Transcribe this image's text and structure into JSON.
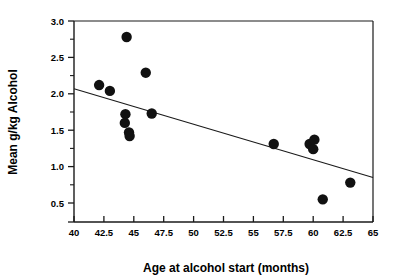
{
  "chart_data": {
    "type": "scatter",
    "title": "",
    "xlabel": "Age at alcohol start (months)",
    "ylabel": "Mean g/kg Alcohol",
    "xlim": [
      40,
      65
    ],
    "ylim": [
      0.5,
      3.0
    ],
    "xticks": [
      40,
      42.5,
      45,
      47.5,
      50,
      52.5,
      55,
      57.5,
      60,
      62.5,
      65
    ],
    "xtick_labels": [
      "40",
      "42.5",
      "45",
      "47.5",
      "50",
      "52.5",
      "55",
      "57.5",
      "60",
      "62.5",
      "65"
    ],
    "yticks": [
      0.5,
      1.0,
      1.5,
      2.0,
      2.5,
      3.0
    ],
    "ytick_labels": [
      "0.5",
      "1.0",
      "1.5",
      "2.0",
      "2.5",
      "3.0"
    ],
    "y_minor_ticks": [
      0.75,
      1.25,
      1.75,
      2.25,
      2.75
    ],
    "grid": false,
    "legend": false,
    "marker": "filled-circle",
    "marker_color": "#111111",
    "marker_size": 6.2,
    "points": [
      {
        "x": 42.1,
        "y": 2.12
      },
      {
        "x": 43.0,
        "y": 2.04
      },
      {
        "x": 44.4,
        "y": 2.78
      },
      {
        "x": 44.3,
        "y": 1.72
      },
      {
        "x": 44.25,
        "y": 1.6
      },
      {
        "x": 44.6,
        "y": 1.47
      },
      {
        "x": 44.65,
        "y": 1.42
      },
      {
        "x": 46.0,
        "y": 2.29
      },
      {
        "x": 46.5,
        "y": 1.73
      },
      {
        "x": 56.7,
        "y": 1.31
      },
      {
        "x": 59.7,
        "y": 1.31
      },
      {
        "x": 60.1,
        "y": 1.37
      },
      {
        "x": 60.0,
        "y": 1.24
      },
      {
        "x": 60.8,
        "y": 0.55
      },
      {
        "x": 63.1,
        "y": 0.78
      }
    ],
    "trendline": {
      "name": "linear fit",
      "x_start": 40,
      "y_start": 2.07,
      "x_end": 65,
      "y_end": 0.85
    }
  },
  "axes": {
    "x_title": "Age at alcohol start (months)",
    "y_title": "Mean g/kg Alcohol"
  }
}
